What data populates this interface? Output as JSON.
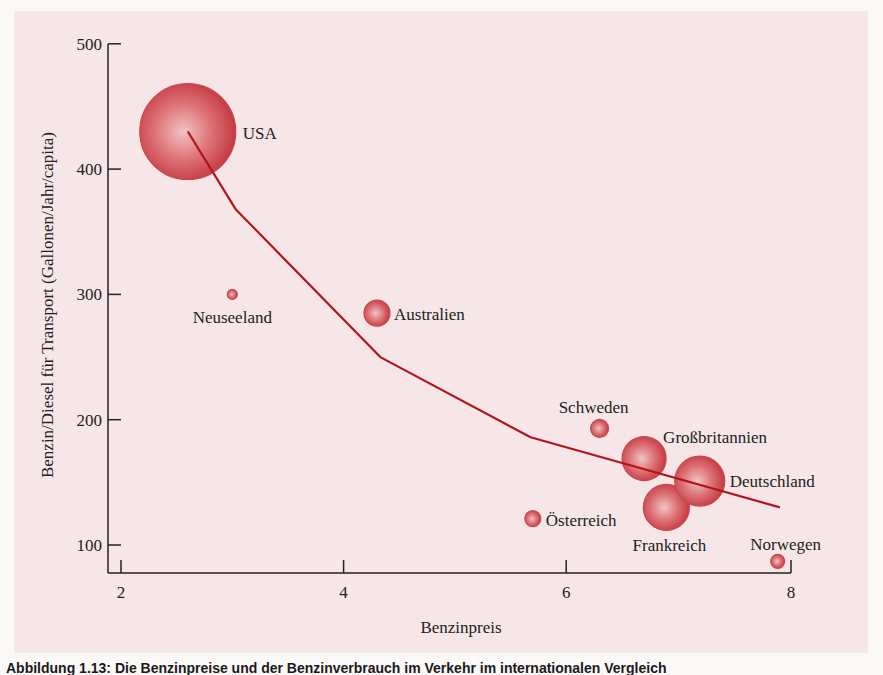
{
  "figure": {
    "caption": "Abbildung 1.13: Die Benzinpreise und der Benzinverbrauch im Verkehr im internationalen Vergleich",
    "colors": {
      "background": "#f6e6e8",
      "bubble": "#c9474c",
      "bubble_highlight": "#f1c3c4",
      "trend_line": "#b3141c",
      "axis": "#222222"
    }
  },
  "chart_data": {
    "type": "scatter",
    "subtype": "bubble",
    "title": "",
    "xlabel": "Benzinpreis",
    "ylabel": "Benzin/Diesel für Transport (Gallonen/Jahr/capita)",
    "xlim": [
      1.8,
      8
    ],
    "ylim": [
      80,
      500
    ],
    "x_ticks": [
      2,
      4,
      6,
      8
    ],
    "y_ticks": [
      100,
      200,
      300,
      400,
      500
    ],
    "grid": false,
    "legend": null,
    "points": [
      {
        "label": "USA",
        "x": 2.6,
        "y": 430,
        "size": 48
      },
      {
        "label": "Neuseeland",
        "x": 3.0,
        "y": 300,
        "size": 5
      },
      {
        "label": "Australien",
        "x": 4.3,
        "y": 285,
        "size": 13
      },
      {
        "label": "Schweden",
        "x": 6.3,
        "y": 193,
        "size": 9
      },
      {
        "label": "Großbritannien",
        "x": 6.7,
        "y": 169,
        "size": 22
      },
      {
        "label": "Deutschland",
        "x": 7.2,
        "y": 151,
        "size": 25
      },
      {
        "label": "Frankreich",
        "x": 6.9,
        "y": 130,
        "size": 23
      },
      {
        "label": "Österreich",
        "x": 5.7,
        "y": 121,
        "size": 8
      },
      {
        "label": "Norwegen",
        "x": 7.9,
        "y": 87,
        "size": 7
      }
    ],
    "trend_line": {
      "x": [
        2.6,
        3.03,
        4.33,
        5.68,
        7.92
      ],
      "y": [
        430,
        368,
        250,
        186,
        130
      ]
    }
  }
}
